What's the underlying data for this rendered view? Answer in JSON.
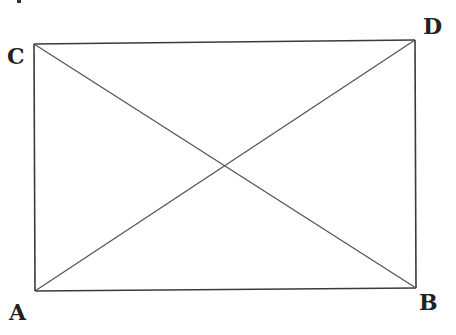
{
  "figure": {
    "type": "rectangle with diagonals",
    "vertices": {
      "A": "A",
      "B": "B",
      "C": "C",
      "D": "D"
    },
    "sides": [
      "AB",
      "BD",
      "DC",
      "CA"
    ],
    "diagonals": [
      "AD",
      "CB"
    ],
    "top_fragment_text": "..."
  }
}
